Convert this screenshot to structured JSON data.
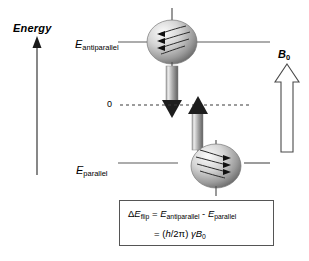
{
  "diagram": {
    "type": "nmr-spin-energy-level-diagram",
    "axis": {
      "title": "Energy",
      "direction": "up",
      "icon": "up-arrow-icon"
    },
    "levels": [
      {
        "id": "antiparallel",
        "symbol": "E",
        "subscript": "antiparallel",
        "position": "upper",
        "spin_direction": "down",
        "sphere_icon": "spinning-nucleus-sphere-icon",
        "precession_arrows": "left"
      },
      {
        "id": "parallel",
        "symbol": "E",
        "subscript": "parallel",
        "position": "lower",
        "spin_direction": "up",
        "sphere_icon": "spinning-nucleus-sphere-icon",
        "precession_arrows": "right"
      }
    ],
    "zero_line": {
      "label": "0",
      "style": "dashed"
    },
    "transition_arrows": [
      {
        "id": "emission",
        "direction": "down",
        "icon": "down-gradient-arrow-icon"
      },
      {
        "id": "absorption",
        "direction": "up",
        "icon": "up-gradient-arrow-icon"
      }
    ],
    "field": {
      "symbol": "B",
      "subscript": "0",
      "icon": "hollow-up-arrow-icon",
      "direction": "up"
    },
    "formula": {
      "line1": {
        "delta": "Δ",
        "e1": "E",
        "e1sub": "flip",
        "equals": "=",
        "e2": "E",
        "e2sub": "antiparallel",
        "minus": "-",
        "e3": "E",
        "e3sub": "parallel"
      },
      "line2": {
        "equals": "=",
        "open": "(",
        "h": "h",
        "slash": "/2",
        "pi": "π",
        "close": ")",
        "gamma": "γ",
        "b": "B",
        "bsub": "0"
      }
    },
    "colors": {
      "line": "#555555",
      "text": "#000000",
      "background": "#ffffff",
      "sphere_light": "#f2f2f2",
      "sphere_dark": "#6e6e6e",
      "arrow_light": "#d8d8d8",
      "arrow_dark": "#1a1a1a"
    }
  }
}
